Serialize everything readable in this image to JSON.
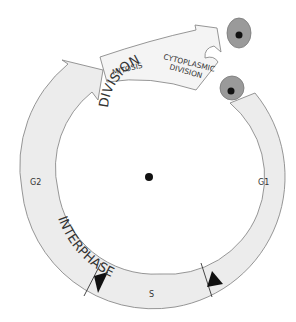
{
  "diagram": {
    "stages": {
      "division_label": "DIVISION",
      "interphase_label": "INTERPHASE",
      "mitosis": "MITOSIS",
      "cytoplasmic_line1": "CYTOPLASMIC",
      "cytoplasmic_line2": "DIVISION"
    },
    "phases": {
      "g1": "G1",
      "s": "S",
      "g2": "G2"
    },
    "icons": [
      "center-dot-icon",
      "daughter-cell-icon",
      "checkpoint-arrow-icon"
    ],
    "colors": {
      "band_fill": "#ececec",
      "band_stroke": "#8a8a8a",
      "cell_fill": "#9a9a9a",
      "nucleus": "#111111",
      "text": "#333333"
    }
  }
}
